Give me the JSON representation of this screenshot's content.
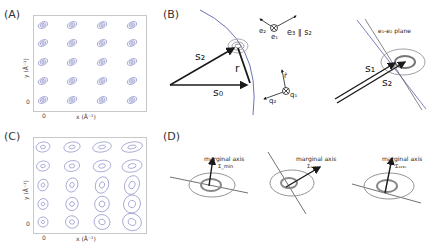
{
  "panels": {
    "A": {
      "label": "(A)",
      "xlabel": "x (Å⁻¹)",
      "ylabel": "y (Å⁻¹)",
      "x_tick": "0",
      "y_tick": "0",
      "grid": {
        "rows": 5,
        "cols": 4
      }
    },
    "B": {
      "label": "(B)",
      "vectors": {
        "s2": "s₂",
        "s0": "s₀",
        "r": "r"
      },
      "basis_top": {
        "e1": "e₁",
        "e2": "e₂",
        "e3": "e₃ ∥ s₂"
      },
      "basis_bottom": {
        "r_hat": "r̂",
        "q1": "q₁",
        "q2": "q₂"
      },
      "right": {
        "plane": "e₁-e₂ plane",
        "s1": "s₁",
        "s2": "s₂"
      }
    },
    "C": {
      "label": "(C)",
      "xlabel": "x (Å⁻¹)",
      "ylabel": "y (Å⁻¹)",
      "x_tick": "0",
      "y_tick": "0",
      "grid": {
        "rows": 5,
        "cols": 4
      }
    },
    "D": {
      "label": "(D)",
      "items": [
        {
          "caption": "marginal axis",
          "sigma": "Σ_min"
        },
        {
          "caption": "marginal axis",
          "sigma": "Σ₁₂₃ₙ"
        },
        {
          "caption": "marginal axis",
          "sigma": "Σ₁₂₃ₙ"
        }
      ]
    }
  },
  "colors": {
    "contour": "#7b7fc0",
    "arrow": "#1a1a1a",
    "ring": "#8a8a8a",
    "sphere": "#6c72b5"
  }
}
